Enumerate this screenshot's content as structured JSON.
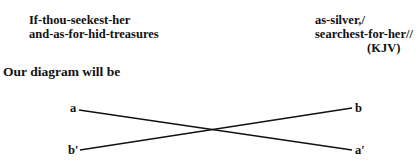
{
  "verse": {
    "left_line1": "If-thou-seekest-her",
    "left_line2": "and-as-for-hid-treasures",
    "right_line1": "as-silver,/",
    "right_line2": "searchest-for-her//",
    "source": "(KJV)"
  },
  "intro": "Our diagram will be",
  "diagram": {
    "labels": {
      "top_left": "a",
      "top_right": "b",
      "bottom_left": "b′",
      "bottom_right": "a′"
    }
  }
}
